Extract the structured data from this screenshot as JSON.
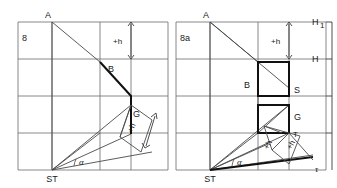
{
  "figure": {
    "type": "technical-line-drawing",
    "stroke_color": "#4a4a4a",
    "bold_stroke_color": "#111111",
    "grid_color": "#6a6a6a",
    "background": "#ffffff"
  },
  "panels": [
    {
      "id": "left",
      "caption": "8",
      "labels": {
        "apex_top": "A",
        "point_b": "B",
        "point_g": "G",
        "station": "ST",
        "angle": "α",
        "dim_upper": "+h",
        "dim_rotated": "+h"
      }
    },
    {
      "id": "right",
      "caption": "8a",
      "labels": {
        "apex_top": "A",
        "point_b": "B",
        "point_g": "G",
        "point_s": "S",
        "point_t": "T",
        "station": "ST",
        "angle": "α",
        "dim_upper": "+h",
        "dim_rotated_1": "+h",
        "dim_rotated_2": "+h",
        "horizon_1": "H",
        "horizon_1_sub": "1",
        "horizon_2": "H",
        "tau": "τ"
      }
    }
  ],
  "geometry": {
    "frame_top_y": 22,
    "frame_bottom_y": 170,
    "left_panel_x": [
      18,
      168
    ],
    "right_panel_x": [
      176,
      326
    ],
    "grid_rows_y": [
      22,
      59,
      96,
      133,
      170
    ],
    "left_grid_cols_x": [
      18,
      52,
      100,
      148,
      168
    ],
    "right_grid_cols_x": [
      176,
      210,
      258,
      306,
      326
    ]
  }
}
